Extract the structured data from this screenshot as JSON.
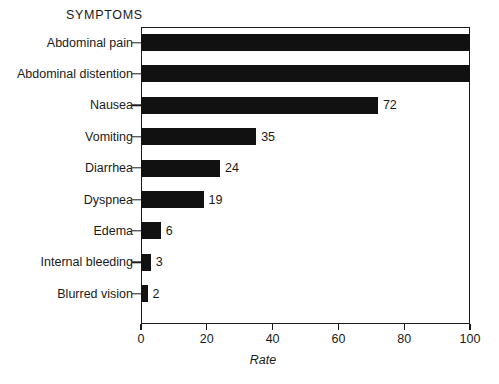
{
  "header": {
    "category_axis_title": "SYMPTOMS"
  },
  "axis": {
    "x_title": "Rate",
    "x_ticks": [
      "0",
      "20",
      "40",
      "60",
      "80",
      "100"
    ]
  },
  "colors": {
    "bar": "#111111",
    "axis": "#1a1a1a",
    "background": "#ffffff"
  },
  "chart_data": {
    "type": "bar",
    "orientation": "horizontal",
    "title": "",
    "subtitle": "",
    "xlabel": "Rate",
    "ylabel": "SYMPTOMS",
    "xlim": [
      0,
      100
    ],
    "xticks": [
      0,
      20,
      40,
      60,
      80,
      100
    ],
    "grid": false,
    "legend": false,
    "categories": [
      "Abdominal pain",
      "Abdominal distention",
      "Nausea",
      "Vomiting",
      "Diarrhea",
      "Dyspnea",
      "Edema",
      "Internal bleeding",
      "Blurred vision"
    ],
    "values": [
      100,
      100,
      72,
      35,
      24,
      19,
      6,
      3,
      2
    ],
    "data_labels": [
      "",
      "",
      "72",
      "35",
      "24",
      "19",
      "6",
      "3",
      "2"
    ]
  }
}
